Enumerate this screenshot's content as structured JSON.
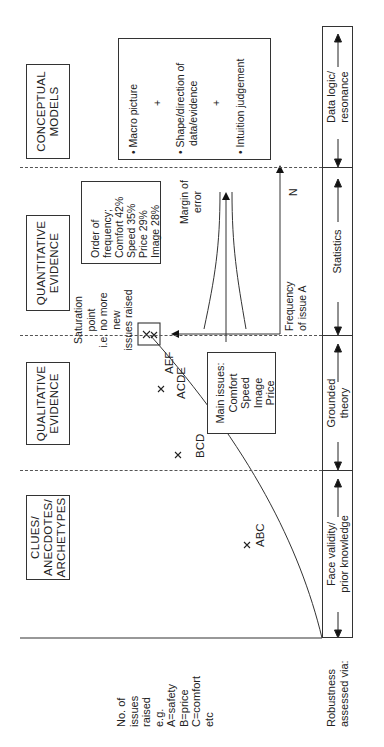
{
  "columns": [
    {
      "title_lines": [
        "CLUES/",
        "ANECDOTES/",
        "ARCHETYPES"
      ]
    },
    {
      "title_lines": [
        "QUALITATIVE",
        "EVIDENCE"
      ]
    },
    {
      "title_lines": [
        "QUANTITATIVE",
        "EVIDENCE"
      ]
    },
    {
      "title_lines": [
        "CONCEPTUAL",
        "MODELS"
      ]
    }
  ],
  "y_axis_label": {
    "lines": [
      "No. of",
      "issues",
      "raised",
      "e.g.",
      "A=safety",
      "B=price",
      "C=comfort",
      "etc"
    ]
  },
  "curve_points": [
    {
      "label": "ABC"
    },
    {
      "label": "BCD"
    },
    {
      "label": "ACDE"
    },
    {
      "label": "AEF"
    }
  ],
  "saturation": {
    "lines": [
      "Saturation",
      "point",
      "i.e. no more",
      "new",
      "issues raised"
    ]
  },
  "main_issues": {
    "lines": [
      "Main issues:",
      "Comfort",
      "Speed",
      "Image",
      "Price"
    ]
  },
  "frequency_box": {
    "lines": [
      "Order of",
      "frequency;",
      "Comfort  42%",
      "Speed  35%",
      "Price  29%",
      "Image  28%"
    ]
  },
  "quant_graph": {
    "margin_label_lines": [
      "Margin of",
      "error"
    ],
    "x_label_lines": [
      "Frequency",
      "of  issue A"
    ],
    "n_label": "N"
  },
  "conceptual_box": {
    "items": [
      "• Macro picture",
      "+",
      "• Shape/direction of",
      "data/evidence",
      "+",
      "• Intuition judgement"
    ]
  },
  "robustness": {
    "row_label_lines": [
      "Robustness",
      "assessed via:"
    ],
    "bands": [
      {
        "lines": [
          "Face validity/",
          "prior knowledge"
        ]
      },
      {
        "lines": [
          "Grounded",
          "theory"
        ]
      },
      {
        "lines": [
          "Statistics"
        ]
      },
      {
        "lines": [
          "Data logic/",
          "resonance"
        ]
      }
    ]
  }
}
